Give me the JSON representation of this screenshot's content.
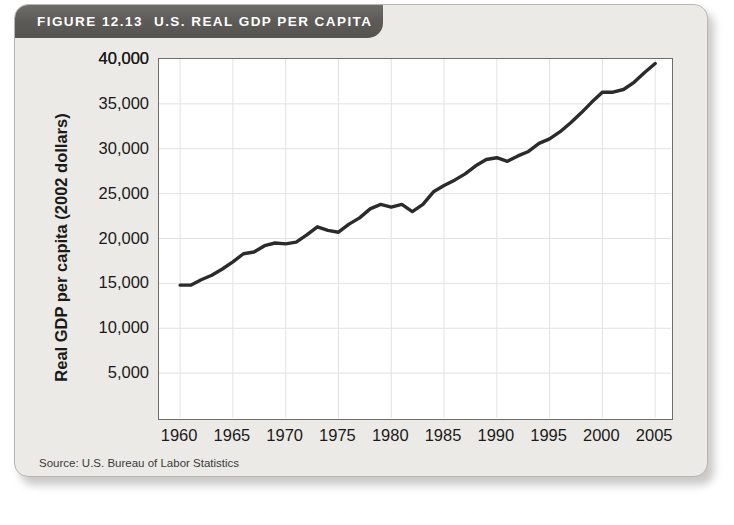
{
  "figure": {
    "number_label": "FIGURE 12.13",
    "title": "U.S. REAL GDP PER CAPITA",
    "source": "Source: U.S. Bureau of Labor Statistics"
  },
  "colors": {
    "banner_dark": "#5e5c59",
    "card_background": "#eceae6",
    "plot_background": "#ffffff",
    "line_color": "#2b2b2b",
    "grid_color": "#e2e2e2",
    "axis_color": "#6f6d6a"
  },
  "chart_data": {
    "type": "line",
    "title": "U.S. REAL GDP PER CAPITA",
    "xlabel": "",
    "ylabel": "Real GDP per capita (2002 dollars)",
    "xlim": [
      1958,
      2006.5
    ],
    "ylim": [
      0,
      40000
    ],
    "xticks": [
      1960,
      1965,
      1970,
      1975,
      1980,
      1985,
      1990,
      1995,
      2000,
      2005
    ],
    "xtick_labels": [
      "1960",
      "1965",
      "1970",
      "1975",
      "1980",
      "1985",
      "1990",
      "1995",
      "2000",
      "2005"
    ],
    "yticks": [
      5000,
      10000,
      15000,
      20000,
      25000,
      30000,
      35000,
      40000
    ],
    "ytick_labels": [
      "5,000",
      "10,000",
      "15,000",
      "20,000",
      "25,000",
      "30,000",
      "35,000",
      "40,000"
    ],
    "grid": true,
    "legend": false,
    "series": [
      {
        "name": "Real GDP per capita (2002 dollars)",
        "x": [
          1960,
          1961,
          1962,
          1963,
          1964,
          1965,
          1966,
          1967,
          1968,
          1969,
          1970,
          1971,
          1972,
          1973,
          1974,
          1975,
          1976,
          1977,
          1978,
          1979,
          1980,
          1981,
          1982,
          1983,
          1984,
          1985,
          1986,
          1987,
          1988,
          1989,
          1990,
          1991,
          1992,
          1993,
          1994,
          1995,
          1996,
          1997,
          1998,
          1999,
          2000,
          2001,
          2002,
          2003,
          2004,
          2005
        ],
        "values": [
          14800,
          14800,
          15400,
          15900,
          16600,
          17400,
          18300,
          18500,
          19200,
          19500,
          19400,
          19600,
          20400,
          21300,
          20900,
          20700,
          21600,
          22300,
          23300,
          23800,
          23500,
          23800,
          23000,
          23800,
          25200,
          25900,
          26500,
          27200,
          28100,
          28800,
          29000,
          28600,
          29200,
          29700,
          30600,
          31100,
          31900,
          32900,
          34000,
          35200,
          36300,
          36300,
          36600,
          37400,
          38500,
          39500
        ]
      }
    ]
  }
}
